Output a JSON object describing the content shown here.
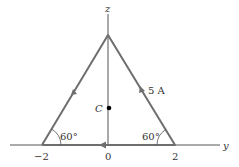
{
  "diagram": {
    "axes": {
      "z_label": "z",
      "y_label": "y"
    },
    "ticks": {
      "left": "−2",
      "origin": "0",
      "right": "2"
    },
    "angles": {
      "left": "60°",
      "right": "60°"
    },
    "current_label": "5 A",
    "center_label": "C",
    "colors": {
      "wire": "#6e6e6e",
      "axis": "#555555",
      "text": "#333333",
      "dot": "#000000"
    }
  }
}
